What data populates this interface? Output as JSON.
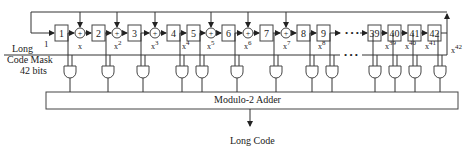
{
  "diagram": {
    "mask_label": [
      "Long",
      "Code Mask",
      "42 bits"
    ],
    "input_label": "1",
    "adder_label": "Modulo-2 Adder",
    "output_label": "Long Code",
    "ellipsis": "• • •",
    "registers": [
      {
        "label": "1",
        "x": 55
      },
      {
        "label": "2",
        "x": 92
      },
      {
        "label": "3",
        "x": 128
      },
      {
        "label": "4",
        "x": 167
      },
      {
        "label": "5",
        "x": 187
      },
      {
        "label": "6",
        "x": 222
      },
      {
        "label": "7",
        "x": 260
      },
      {
        "label": "8",
        "x": 297
      },
      {
        "label": "9",
        "x": 317
      },
      {
        "label": "39",
        "x": 368
      },
      {
        "label": "40",
        "x": 388
      },
      {
        "label": "41",
        "x": 408
      },
      {
        "label": "42",
        "x": 428
      }
    ],
    "xor_nodes": [
      {
        "x": 80,
        "tap": "x"
      },
      {
        "x": 117,
        "tap": "x2"
      },
      {
        "x": 155,
        "tap": "x3"
      },
      {
        "x": 211,
        "tap": "x5"
      },
      {
        "x": 248,
        "tap": "x6"
      },
      {
        "x": 286,
        "tap": "x7"
      }
    ],
    "tap_labels": [
      {
        "base": "x",
        "exp": "",
        "x": 78
      },
      {
        "base": "x",
        "exp": "2",
        "x": 114
      },
      {
        "base": "x",
        "exp": "3",
        "x": 151
      },
      {
        "base": "x",
        "exp": "4",
        "x": 182
      },
      {
        "base": "x",
        "exp": "5",
        "x": 207
      },
      {
        "base": "x",
        "exp": "6",
        "x": 244
      },
      {
        "base": "x",
        "exp": "7",
        "x": 283
      },
      {
        "base": "x",
        "exp": "8",
        "x": 318
      },
      {
        "base": "x",
        "exp": "39",
        "x": 385
      },
      {
        "base": "x",
        "exp": "40",
        "x": 405
      },
      {
        "base": "x",
        "exp": "41",
        "x": 425
      },
      {
        "base": "x",
        "exp": "42",
        "x": 451
      }
    ],
    "and_gates_x": [
      70,
      108,
      143,
      182,
      202,
      237,
      276,
      312,
      332,
      375,
      395,
      415,
      440
    ]
  }
}
